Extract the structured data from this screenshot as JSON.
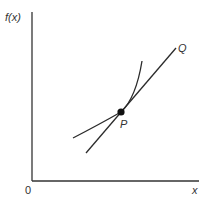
{
  "diagram": {
    "type": "tangent-to-curve",
    "axes": {
      "y_label": "f(x)",
      "x_label": "x",
      "origin_label": "0"
    },
    "point_P": {
      "label": "P"
    },
    "tangent_end": {
      "label": "Q"
    },
    "colors": {
      "line": "#2b2b2b",
      "text": "#333333",
      "background": "#ffffff"
    }
  }
}
